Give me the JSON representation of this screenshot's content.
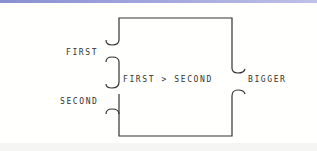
{
  "diagram": {
    "inputs": [
      {
        "label": "FIRST"
      },
      {
        "label": "SECOND"
      }
    ],
    "operation": "FIRST > SECOND",
    "output": "BIGGER"
  },
  "colors": {
    "line": "#333333",
    "top_bar": "#9a9edb"
  }
}
